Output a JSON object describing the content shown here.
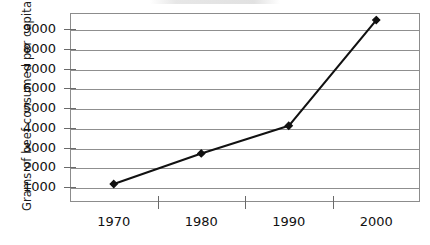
{
  "chart_data": {
    "type": "line",
    "title": "",
    "xlabel": "",
    "ylabel": "Grams of beef consumed per capita",
    "categories": [
      "1970",
      "1980",
      "1990",
      "2000"
    ],
    "values": [
      1150,
      2700,
      4100,
      9450
    ],
    "series": [
      {
        "name": "Beef consumed per capita",
        "values": [
          1150,
          2700,
          4100,
          9450
        ]
      }
    ],
    "ytick_labels": [
      "1000",
      "2000",
      "3000",
      "4000",
      "5000",
      "6000",
      "7000",
      "8000",
      "9000"
    ],
    "ytick_values": [
      1000,
      2000,
      3000,
      4000,
      5000,
      6000,
      7000,
      8000,
      9000
    ],
    "ylim": [
      0,
      9600
    ],
    "xlim": [
      0,
      4
    ],
    "grid": "horizontal",
    "legend": "none",
    "marker": "diamond",
    "line_color": "#111111",
    "grid_color": "#8f8f8f",
    "frame_color": "#8c8c8c",
    "text_color": "#111111",
    "background_color": "#ffffff"
  },
  "axes": {
    "y_title": "Grams of beef consumed per capita",
    "y_ticks": [
      {
        "label": "9000",
        "value": 9000
      },
      {
        "label": "8000",
        "value": 8000
      },
      {
        "label": "7000",
        "value": 7000
      },
      {
        "label": "6000",
        "value": 6000
      },
      {
        "label": "5000",
        "value": 5000
      },
      {
        "label": "4000",
        "value": 4000
      },
      {
        "label": "3000",
        "value": 3000
      },
      {
        "label": "2000",
        "value": 2000
      },
      {
        "label": "1000",
        "value": 1000
      }
    ],
    "x_ticks": [
      {
        "label": "1970"
      },
      {
        "label": "1980"
      },
      {
        "label": "1990"
      },
      {
        "label": "2000"
      }
    ]
  },
  "title_artifact": {
    "text": ""
  }
}
